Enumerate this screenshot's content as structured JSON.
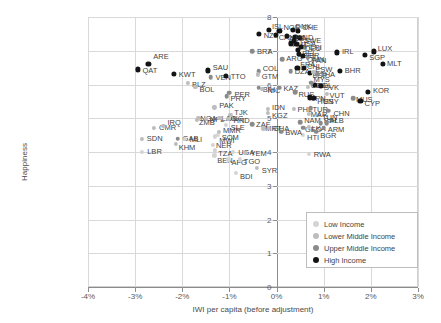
{
  "chart_data": {
    "type": "scatter",
    "title": "",
    "xlabel": "IWI per capita (before adjustment)",
    "ylabel": "Happiness",
    "xlim": [
      -4,
      3
    ],
    "ylim": [
      0,
      8
    ],
    "xticks": [
      "-4%",
      "-3%",
      "-2%",
      "-1%",
      "0%",
      "1%",
      "2%",
      "3%"
    ],
    "xtick_values": [
      -4,
      -3,
      -2,
      -1,
      0,
      1,
      2,
      3
    ],
    "yticks": [
      "0",
      "1",
      "2",
      "3",
      "4",
      "5",
      "6",
      "7",
      "8"
    ],
    "ytick_values": [
      0,
      1,
      2,
      3,
      4,
      5,
      6,
      7,
      8
    ],
    "grid": true,
    "legend_position": "bottom-right",
    "series": [
      {
        "name": "Low Income",
        "color": "#d4d4d4"
      },
      {
        "name": "Lower Middle Income",
        "color": "#bdbdbd"
      },
      {
        "name": "Upper Middle Income",
        "color": "#8a8a8a"
      },
      {
        "name": "High Income",
        "color": "#141414"
      }
    ],
    "points": [
      {
        "label": "QAT",
        "x": -2.95,
        "y": 6.45,
        "group": 3,
        "lx": 5,
        "ly": 2
      },
      {
        "label": "ARE",
        "x": -2.72,
        "y": 6.62,
        "group": 3,
        "lx": 5,
        "ly": -7
      },
      {
        "label": "KWT",
        "x": -2.18,
        "y": 6.32,
        "group": 3,
        "lx": 5,
        "ly": 1
      },
      {
        "label": "BLZ",
        "x": -1.88,
        "y": 6.05,
        "group": 1,
        "lx": 4,
        "ly": 2
      },
      {
        "label": "BOL",
        "x": -1.72,
        "y": 5.92,
        "group": 1,
        "lx": 4,
        "ly": 3
      },
      {
        "label": "SAU",
        "x": -1.46,
        "y": 6.42,
        "group": 3,
        "lx": 5,
        "ly": -2
      },
      {
        "label": "VEN",
        "x": -1.4,
        "y": 6.22,
        "group": 2,
        "lx": 5,
        "ly": 1
      },
      {
        "label": "TTO",
        "x": -1.08,
        "y": 6.25,
        "group": 3,
        "lx": 5,
        "ly": 1
      },
      {
        "label": "PER",
        "x": -1.0,
        "y": 5.76,
        "group": 2,
        "lx": 5,
        "ly": 2
      },
      {
        "label": "PRY",
        "x": -1.06,
        "y": 5.65,
        "group": 2,
        "lx": 4,
        "ly": 3
      },
      {
        "label": "PAK",
        "x": -1.32,
        "y": 5.32,
        "group": 1,
        "lx": 5,
        "ly": -1
      },
      {
        "label": "NGA",
        "x": -1.66,
        "y": 5.02,
        "group": 1,
        "lx": 2,
        "ly": 1
      },
      {
        "label": "ZMB",
        "x": -1.69,
        "y": 4.95,
        "group": 1,
        "lx": 2,
        "ly": 3
      },
      {
        "label": "NPL",
        "x": -1.5,
        "y": 4.98,
        "group": 1,
        "lx": 4,
        "ly": 1
      },
      {
        "label": "LAO",
        "x": -1.23,
        "y": 5.02,
        "group": 1,
        "lx": 3,
        "ly": 1
      },
      {
        "label": "DNG",
        "x": -1.18,
        "y": 5.0,
        "group": 1,
        "lx": 6,
        "ly": 1
      },
      {
        "label": "HND",
        "x": -1.02,
        "y": 4.98,
        "group": 1,
        "lx": 5,
        "ly": 2
      },
      {
        "label": "TJK",
        "x": -0.98,
        "y": 5.1,
        "group": 1,
        "lx": 4,
        "ly": -2
      },
      {
        "label": "SLE",
        "x": -1.08,
        "y": 4.8,
        "group": 0,
        "lx": 5,
        "ly": 3
      },
      {
        "label": "MMR",
        "x": -1.22,
        "y": 4.6,
        "group": 1,
        "lx": 4,
        "ly": -1
      },
      {
        "label": "SOM",
        "x": -1.25,
        "y": 4.5,
        "group": 0,
        "lx": 4,
        "ly": 3
      },
      {
        "label": "MWI",
        "x": -1.3,
        "y": 4.46,
        "group": 0,
        "lx": 4,
        "ly": 5
      },
      {
        "label": "CMR",
        "x": -2.6,
        "y": 4.72,
        "group": 1,
        "lx": 5,
        "ly": 0
      },
      {
        "label": "IRQ",
        "x": -2.4,
        "y": 4.78,
        "group": 1,
        "lx": 4,
        "ly": -3
      },
      {
        "label": "SDN",
        "x": -2.86,
        "y": 4.38,
        "group": 1,
        "lx": 5,
        "ly": 0
      },
      {
        "label": "GAB",
        "x": -2.1,
        "y": 4.4,
        "group": 2,
        "lx": 5,
        "ly": 0
      },
      {
        "label": "MLI",
        "x": -1.95,
        "y": 4.38,
        "group": 0,
        "lx": 5,
        "ly": 1
      },
      {
        "label": "KHM",
        "x": -2.14,
        "y": 4.25,
        "group": 1,
        "lx": 3,
        "ly": 4
      },
      {
        "label": "LBR",
        "x": -2.85,
        "y": 4.0,
        "group": 0,
        "lx": 5,
        "ly": 0
      },
      {
        "label": "NER",
        "x": -1.35,
        "y": 4.2,
        "group": 0,
        "lx": 3,
        "ly": 1
      },
      {
        "label": "TZA",
        "x": -1.3,
        "y": 4.05,
        "group": 0,
        "lx": 3,
        "ly": 4
      },
      {
        "label": "BEN",
        "x": -1.32,
        "y": 3.9,
        "group": 0,
        "lx": 3,
        "ly": 6
      },
      {
        "label": "UGA",
        "x": -0.92,
        "y": 4.0,
        "group": 0,
        "lx": 5,
        "ly": 1
      },
      {
        "label": "AFG",
        "x": -1.02,
        "y": 3.78,
        "group": 0,
        "lx": 3,
        "ly": 4
      },
      {
        "label": "TGO",
        "x": -0.78,
        "y": 3.78,
        "group": 0,
        "lx": 4,
        "ly": 3
      },
      {
        "label": "YEM",
        "x": -0.66,
        "y": 3.98,
        "group": 1,
        "lx": 5,
        "ly": 1
      },
      {
        "label": "BDI",
        "x": -0.86,
        "y": 3.38,
        "group": 0,
        "lx": 4,
        "ly": 4
      },
      {
        "label": "SYR",
        "x": -0.42,
        "y": 3.52,
        "group": 1,
        "lx": 5,
        "ly": 3
      },
      {
        "label": "BRA",
        "x": -0.52,
        "y": 6.98,
        "group": 2,
        "lx": 5,
        "ly": 1
      },
      {
        "label": "COL",
        "x": -0.38,
        "y": 6.4,
        "group": 2,
        "lx": 4,
        "ly": -2
      },
      {
        "label": "GTM",
        "x": -0.4,
        "y": 6.3,
        "group": 1,
        "lx": 4,
        "ly": 3
      },
      {
        "label": "BIH",
        "x": -0.38,
        "y": 5.9,
        "group": 2,
        "lx": 4,
        "ly": 2
      },
      {
        "label": "NIC",
        "x": -0.3,
        "y": 5.88,
        "group": 1,
        "lx": 5,
        "ly": 2
      },
      {
        "label": "IDN",
        "x": -0.18,
        "y": 5.28,
        "group": 1,
        "lx": 4,
        "ly": -1
      },
      {
        "label": "KGZ",
        "x": -0.18,
        "y": 5.15,
        "group": 1,
        "lx": 4,
        "ly": 3
      },
      {
        "label": "NZL",
        "x": -0.38,
        "y": 7.5,
        "group": 3,
        "lx": 5,
        "ly": 2
      },
      {
        "label": "ISL",
        "x": -0.16,
        "y": 7.62,
        "group": 3,
        "lx": 3,
        "ly": -3
      },
      {
        "label": "CRI",
        "x": 0.58,
        "y": 7.1,
        "group": 2,
        "lx": 5,
        "ly": 1
      },
      {
        "label": "NOR",
        "x": 0.06,
        "y": 7.6,
        "group": 3,
        "lx": 4,
        "ly": -3
      },
      {
        "label": "CAN",
        "x": -0.02,
        "y": 7.48,
        "group": 3,
        "lx": 3,
        "ly": 3
      },
      {
        "label": "DNK",
        "x": 0.34,
        "y": 7.62,
        "group": 3,
        "lx": 3,
        "ly": -3
      },
      {
        "label": "CHE",
        "x": 0.46,
        "y": 7.6,
        "group": 3,
        "lx": 4,
        "ly": -3
      },
      {
        "label": "AUS",
        "x": 0.22,
        "y": 7.45,
        "group": 3,
        "lx": 2,
        "ly": 3
      },
      {
        "label": "NLD",
        "x": 0.4,
        "y": 7.42,
        "group": 3,
        "lx": 3,
        "ly": 1
      },
      {
        "label": "SWE",
        "x": 0.5,
        "y": 7.38,
        "group": 3,
        "lx": 4,
        "ly": 3
      },
      {
        "label": "AUT",
        "x": 0.3,
        "y": 7.22,
        "group": 3,
        "lx": 2,
        "ly": 2
      },
      {
        "label": "USA",
        "x": 0.42,
        "y": 7.2,
        "group": 3,
        "lx": 4,
        "ly": 0
      },
      {
        "label": "FIN",
        "x": 0.36,
        "y": 7.3,
        "group": 3,
        "lx": 2,
        "ly": -3
      },
      {
        "label": "DEU",
        "x": 0.52,
        "y": 7.12,
        "group": 3,
        "lx": 4,
        "ly": 2
      },
      {
        "label": "BEL",
        "x": 0.46,
        "y": 7.02,
        "group": 3,
        "lx": 4,
        "ly": 4
      },
      {
        "label": "ARG",
        "x": 0.12,
        "y": 6.75,
        "group": 2,
        "lx": 4,
        "ly": 0
      },
      {
        "label": "GBR",
        "x": 0.48,
        "y": 6.9,
        "group": 3,
        "lx": 4,
        "ly": 2
      },
      {
        "label": "OMN",
        "x": 0.56,
        "y": 6.85,
        "group": 3,
        "lx": 4,
        "ly": 4
      },
      {
        "label": "PAN",
        "x": 0.66,
        "y": 6.8,
        "group": 2,
        "lx": 4,
        "ly": 3
      },
      {
        "label": "DZA",
        "x": 0.3,
        "y": 6.4,
        "group": 2,
        "lx": 4,
        "ly": 1
      },
      {
        "label": "FRA",
        "x": 0.44,
        "y": 6.48,
        "group": 3,
        "lx": 3,
        "ly": -3
      },
      {
        "label": "CHL",
        "x": 0.58,
        "y": 6.5,
        "group": 3,
        "lx": 3,
        "ly": -1
      },
      {
        "label": "ESP",
        "x": 0.7,
        "y": 6.35,
        "group": 3,
        "lx": 3,
        "ly": 3
      },
      {
        "label": "THA",
        "x": 0.86,
        "y": 6.3,
        "group": 2,
        "lx": 3,
        "ly": 1
      },
      {
        "label": "ESW",
        "x": 0.78,
        "y": 6.38,
        "group": 1,
        "lx": 2,
        "ly": -2
      },
      {
        "label": "IRL",
        "x": 1.28,
        "y": 6.95,
        "group": 3,
        "lx": 5,
        "ly": 0
      },
      {
        "label": "SGP",
        "x": 1.88,
        "y": 6.88,
        "group": 3,
        "lx": 4,
        "ly": 3
      },
      {
        "label": "LUX",
        "x": 2.06,
        "y": 6.98,
        "group": 3,
        "lx": 4,
        "ly": -2
      },
      {
        "label": "MLT",
        "x": 2.26,
        "y": 6.6,
        "group": 3,
        "lx": 4,
        "ly": 0
      },
      {
        "label": "BHR",
        "x": 1.34,
        "y": 6.4,
        "group": 3,
        "lx": 5,
        "ly": 0
      },
      {
        "label": "KAZ",
        "x": 0.06,
        "y": 5.9,
        "group": 2,
        "lx": 4,
        "ly": 1
      },
      {
        "label": "RUS",
        "x": 0.4,
        "y": 5.78,
        "group": 2,
        "lx": 3,
        "ly": 3
      },
      {
        "label": "UZB",
        "x": 0.66,
        "y": 5.92,
        "group": 1,
        "lx": 3,
        "ly": -1
      },
      {
        "label": "POL",
        "x": 0.82,
        "y": 5.98,
        "group": 3,
        "lx": 2,
        "ly": 1
      },
      {
        "label": "SVK",
        "x": 0.94,
        "y": 5.95,
        "group": 3,
        "lx": 3,
        "ly": 2
      },
      {
        "label": "MYS",
        "x": 0.74,
        "y": 6.05,
        "group": 2,
        "lx": 2,
        "ly": -3
      },
      {
        "label": "VUT",
        "x": 1.06,
        "y": 5.72,
        "group": 1,
        "lx": 3,
        "ly": 2
      },
      {
        "label": "ESY",
        "x": 0.96,
        "y": 5.58,
        "group": 1,
        "lx": 2,
        "ly": 3
      },
      {
        "label": "JPN",
        "x": 0.7,
        "y": 5.62,
        "group": 3,
        "lx": 2,
        "ly": 2
      },
      {
        "label": "HUN",
        "x": 0.8,
        "y": 5.6,
        "group": 3,
        "lx": 3,
        "ly": 4
      },
      {
        "label": "MUS",
        "x": 1.62,
        "y": 5.6,
        "group": 2,
        "lx": 3,
        "ly": 2
      },
      {
        "label": "CYP",
        "x": 1.78,
        "y": 5.52,
        "group": 3,
        "lx": 4,
        "ly": 3
      },
      {
        "label": "KOR",
        "x": 1.94,
        "y": 5.78,
        "group": 3,
        "lx": 5,
        "ly": -1
      },
      {
        "label": "PHL",
        "x": 0.36,
        "y": 5.28,
        "group": 1,
        "lx": 4,
        "ly": 1
      },
      {
        "label": "TUR",
        "x": 0.72,
        "y": 5.3,
        "group": 2,
        "lx": 2,
        "ly": 2
      },
      {
        "label": "CHN",
        "x": 1.1,
        "y": 5.22,
        "group": 2,
        "lx": 5,
        "ly": 3
      },
      {
        "label": "TUN",
        "x": 0.9,
        "y": 5.1,
        "group": 1,
        "lx": 3,
        "ly": 3
      },
      {
        "label": "MAR",
        "x": 0.68,
        "y": 5.12,
        "group": 1,
        "lx": 2,
        "ly": 1
      },
      {
        "label": "NAM",
        "x": 0.5,
        "y": 4.88,
        "group": 2,
        "lx": 4,
        "ly": -1
      },
      {
        "label": "GEO",
        "x": 0.56,
        "y": 4.72,
        "group": 2,
        "lx": 2,
        "ly": 2
      },
      {
        "label": "LKA",
        "x": 0.68,
        "y": 4.75,
        "group": 1,
        "lx": 3,
        "ly": 2
      },
      {
        "label": "BIH2",
        "x": 0.94,
        "y": 4.85,
        "group": 2,
        "lx": 3,
        "ly": -2
      },
      {
        "label": "ALB",
        "x": 1.06,
        "y": 4.86,
        "group": 2,
        "lx": 3,
        "ly": -2
      },
      {
        "label": "ARM",
        "x": 1.0,
        "y": 4.72,
        "group": 2,
        "lx": 4,
        "ly": 2
      },
      {
        "label": "BGR",
        "x": 0.84,
        "y": 4.6,
        "group": 2,
        "lx": 4,
        "ly": 4
      },
      {
        "label": "HTI",
        "x": 0.56,
        "y": 4.5,
        "group": 0,
        "lx": 4,
        "ly": 3
      },
      {
        "label": "ZAF",
        "x": -0.52,
        "y": 4.82,
        "group": 2,
        "lx": 4,
        "ly": 1
      },
      {
        "label": "MRT",
        "x": -0.28,
        "y": 4.7,
        "group": 1,
        "lx": 2,
        "ly": 1
      },
      {
        "label": "GHA",
        "x": -0.16,
        "y": 4.72,
        "group": 1,
        "lx": 4,
        "ly": 1
      },
      {
        "label": "BWA",
        "x": 0.1,
        "y": 4.6,
        "group": 2,
        "lx": 4,
        "ly": 1
      },
      {
        "label": "RWA",
        "x": 0.68,
        "y": 3.95,
        "group": 0,
        "lx": 5,
        "ly": 1
      }
    ]
  },
  "legend": {
    "items": [
      {
        "label": "Low Income"
      },
      {
        "label": "Lower Middle Income"
      },
      {
        "label": "Upper Middle Income"
      },
      {
        "label": "High Income"
      }
    ]
  }
}
